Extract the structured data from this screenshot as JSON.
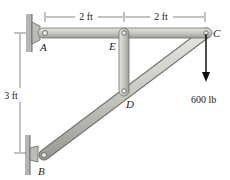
{
  "figure": {
    "points": {
      "A": "A",
      "B": "B",
      "C": "C",
      "D": "D",
      "E": "E"
    },
    "dimensions": {
      "top_left": "2 ft",
      "top_right": "2 ft",
      "vertical": "3 ft"
    },
    "load": {
      "label": "600 lb",
      "direction": "down"
    },
    "colors": {
      "member_fill": "#c9cbc4",
      "member_stroke": "#6f716b",
      "wall": "#a8a8a8",
      "arrow": "#111111"
    }
  }
}
